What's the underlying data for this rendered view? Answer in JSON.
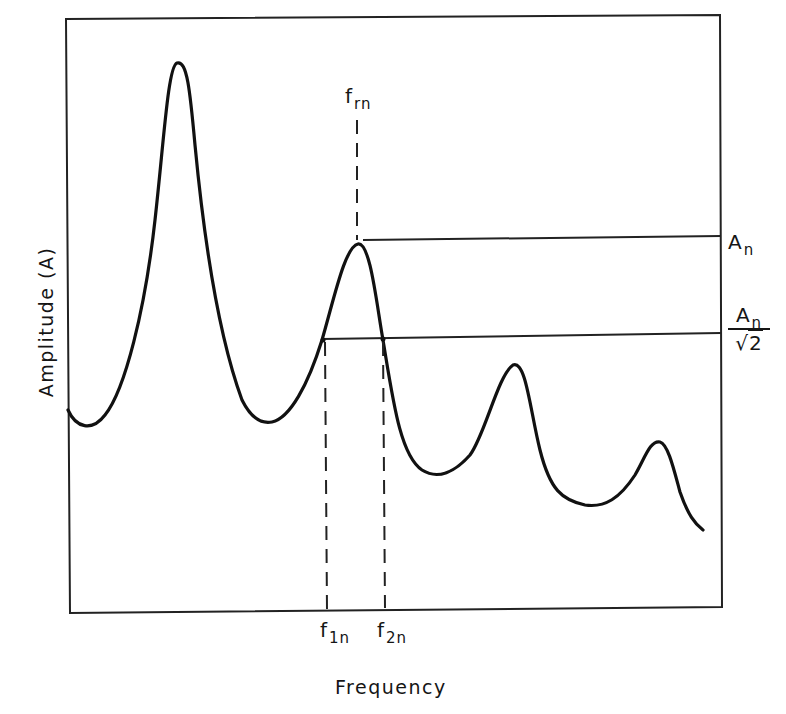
{
  "diagram": {
    "type": "frequency-response",
    "axes": {
      "x_label": "Frequency",
      "y_label": "Amplitude (A)"
    },
    "annotations": {
      "resonant_frequency": {
        "symbol": "f",
        "subscript": "rn"
      },
      "lower_half_power_frequency": {
        "symbol": "f",
        "subscript": "1n"
      },
      "upper_half_power_frequency": {
        "symbol": "f",
        "subscript": "2n"
      },
      "peak_amplitude": {
        "symbol": "A",
        "subscript": "n"
      },
      "half_power_amplitude": {
        "numerator_symbol": "A",
        "numerator_subscript": "n",
        "denominator_radical": "√",
        "denominator_value": "2"
      }
    },
    "curve": {
      "peaks": 4,
      "stroke_color": "#111111",
      "note": "Curve starts low at left, large first peak, medium nth peak at f_rn, then two progressively smaller peaks"
    },
    "colors": {
      "ink": "#111111",
      "background": "#ffffff"
    }
  }
}
